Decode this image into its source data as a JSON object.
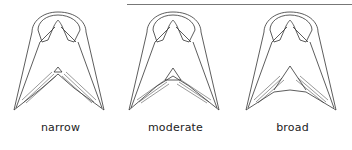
{
  "figures": [
    {
      "label": "narrow"
    },
    {
      "label": "moderate"
    },
    {
      "label": "broad"
    }
  ],
  "colors": {
    "stroke": "#333333",
    "rule": "#777777"
  }
}
